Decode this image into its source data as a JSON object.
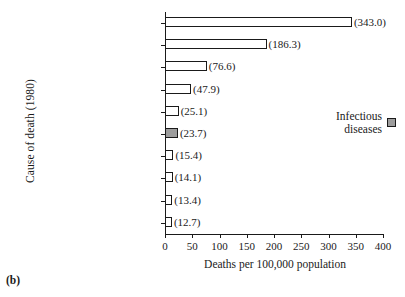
{
  "caption": "(b)",
  "legend": {
    "label": "Infectious\ndiseases",
    "swatch_name": "gray-square-swatch",
    "swatch_color": "#9d9d9d"
  },
  "chart_data": {
    "type": "bar",
    "orientation": "horizontal",
    "title": "",
    "xlabel": "Deaths per 100,000 population",
    "ylabel": "Cause of death (1980)",
    "xlim": [
      0,
      400
    ],
    "xticks": [
      0,
      50,
      100,
      150,
      200,
      250,
      300,
      350,
      400
    ],
    "xtick_labels": [
      "0",
      "50",
      "100",
      "150",
      "200",
      "250",
      "300",
      "350",
      "400"
    ],
    "grid": false,
    "legend_position": "right-middle",
    "categories": [
      "Diseases of the heart",
      "Malignant neoplasms",
      "Cerebrovascular diseases",
      "All accidents",
      "Chronic obstructive\npulmonary diseases",
      "Pneumonia (all forms)\nand influenza",
      "Diabetes mellitus",
      "Cirrhosis of the liver",
      "Atherosclerosis",
      "Suicide"
    ],
    "values": [
      343.0,
      186.3,
      76.6,
      47.9,
      25.1,
      23.7,
      15.4,
      14.1,
      13.4,
      12.7
    ],
    "value_labels": [
      "(343.0)",
      "(186.3)",
      "(76.6)",
      "(47.9)",
      "(25.1)",
      "(23.7)",
      "(15.4)",
      "(14.1)",
      "(13.4)",
      "(12.7)"
    ],
    "highlighted_index": 5,
    "highlight_color": "#9d9d9d",
    "bar_fill": "#ffffff",
    "bar_edge": "#1a1a1a"
  }
}
